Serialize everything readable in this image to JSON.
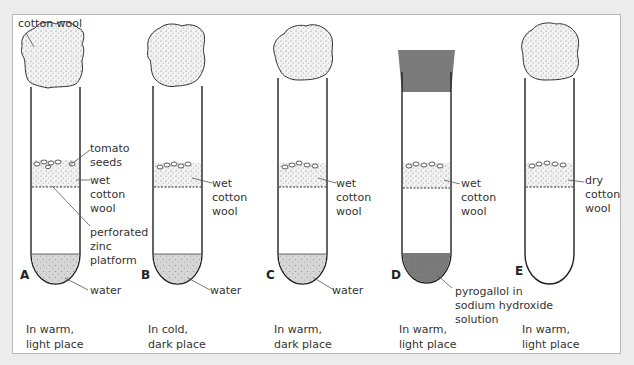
{
  "figure": {
    "colors": {
      "page_background": "#ececec",
      "panel_background": "#ffffff",
      "panel_border": "#b8b8b8",
      "water_fill": "#d3d3d3",
      "pyrogallol_fill": "#7a7a7a",
      "stopper_fill": "#7a7a7a",
      "outline": "#222222"
    },
    "labels": {
      "cotton_wool": "cotton wool",
      "tomato_seeds": [
        "tomato",
        "seeds"
      ],
      "wet_cotton_wool": [
        "wet",
        "cotton",
        "wool"
      ],
      "perforated_zinc_platform": [
        "perforated",
        "zinc",
        "platform"
      ],
      "water": "water",
      "pyrogallol": [
        "pyrogallol in",
        "sodium hydroxide",
        "solution"
      ],
      "dry_cotton_wool": [
        "dry",
        "cotton",
        "wool"
      ]
    },
    "tubes": [
      {
        "id": "A",
        "letter": "A",
        "liquid": "water",
        "cotton": "wet cotton wool",
        "condition": [
          "In warm,",
          "light place"
        ]
      },
      {
        "id": "B",
        "letter": "B",
        "liquid": "water",
        "cotton": "wet cotton wool",
        "condition": [
          "In cold,",
          "dark place"
        ]
      },
      {
        "id": "C",
        "letter": "C",
        "liquid": "water",
        "cotton": "wet cotton wool",
        "condition": [
          "In warm,",
          "dark place"
        ]
      },
      {
        "id": "D",
        "letter": "D",
        "liquid": "pyrogallol in sodium hydroxide solution",
        "cotton": "wet cotton wool",
        "condition": [
          "In warm,",
          "light place"
        ]
      },
      {
        "id": "E",
        "letter": "E",
        "liquid": "none",
        "cotton": "dry cotton wool",
        "condition": [
          "In warm,",
          "light place"
        ]
      }
    ]
  }
}
